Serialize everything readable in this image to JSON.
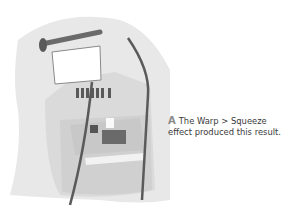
{
  "figure": {
    "colors": {
      "background_shape": "#e6e6e6",
      "booth": "#d4d4d4",
      "pole": "#6a6a6a",
      "sign": "#ffffff"
    }
  },
  "caption": {
    "letter": "A",
    "line1": "The Warp > Squeeze",
    "line2": "effect produced this result."
  }
}
